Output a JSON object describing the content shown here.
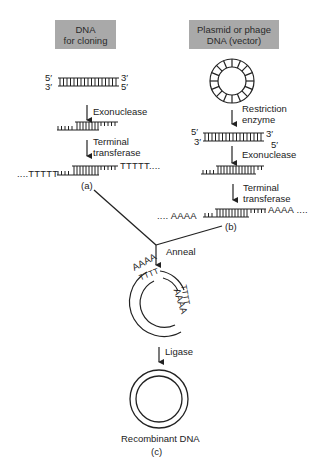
{
  "left_column": {
    "title_line1": "DNA",
    "title_line2": "for cloning",
    "end_top_left": "5′",
    "end_top_right": "3′",
    "end_bottom_left": "3′",
    "end_bottom_right": "5′",
    "step1": "Exonuclease",
    "step2_line1": "Terminal",
    "step2_line2": "transferase",
    "tail_left": "....TTTTT",
    "tail_right": "TTTTT....",
    "panel_label": "(a)"
  },
  "right_column": {
    "title_line1": "Plasmid or phage",
    "title_line2": "DNA (vector)",
    "step1_line1": "Restriction",
    "step1_line2": "enzyme",
    "end_top_left": "5′",
    "end_top_right": "3′",
    "end_bottom_left": "3′",
    "end_bottom_right": "5′",
    "step2": "Exonuclease",
    "step3_line1": "Terminal",
    "step3_line2": "transferase",
    "tail_left": ".... AAAA",
    "tail_right": "AAAA ....",
    "panel_label": "(b)"
  },
  "merge": {
    "step_anneal": "Anneal",
    "annealed_seq_outer_top": "AAAA",
    "annealed_seq_inner_top": "TTTT",
    "annealed_seq_outer_right": "TTTT",
    "annealed_seq_inner_right": "AAAA",
    "step_ligase": "Ligase",
    "result_label": "Recombinant DNA",
    "panel_label": "(c)"
  }
}
